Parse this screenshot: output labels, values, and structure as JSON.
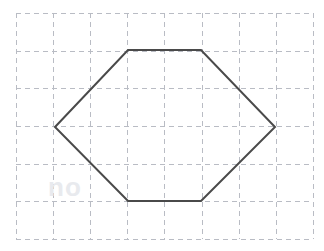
{
  "figure": {
    "canvas": {
      "width": 324,
      "height": 251,
      "background_color": "#ffffff"
    },
    "grid": {
      "color": "#b9bcc4",
      "dash": "5 4",
      "stroke_width": 1,
      "origin_x": 16,
      "origin_y": 13,
      "cell_width": 37.1,
      "cell_height": 37.7,
      "columns": 8,
      "rows": 6,
      "vertical_x": [
        16,
        53,
        90,
        127,
        164,
        202,
        239,
        276,
        313
      ],
      "horizontal_y": [
        13,
        51,
        88,
        126,
        164,
        201,
        239
      ]
    },
    "shape": {
      "name": "hexagon",
      "type": "polygon",
      "sides": 6,
      "stroke_color": "#4a4a4a",
      "stroke_width": 2,
      "fill": "none",
      "points": "55,127 128,50 201,50 275,127 201,201 128,201",
      "vertices": [
        {
          "label": "left",
          "x": 55,
          "y": 127,
          "grid_col": 1,
          "grid_row": 3
        },
        {
          "label": "top-left",
          "x": 128,
          "y": 50,
          "grid_col": 3,
          "grid_row": 1
        },
        {
          "label": "top-right",
          "x": 201,
          "y": 50,
          "grid_col": 5,
          "grid_row": 1
        },
        {
          "label": "right",
          "x": 275,
          "y": 127,
          "grid_col": 7,
          "grid_row": 3
        },
        {
          "label": "bottom-right",
          "x": 201,
          "y": 201,
          "grid_col": 5,
          "grid_row": 5
        },
        {
          "label": "bottom-left",
          "x": 128,
          "y": 201,
          "grid_col": 3,
          "grid_row": 5
        }
      ]
    },
    "watermark": {
      "color": "#e8eaee",
      "items": [
        {
          "text": "no",
          "x": 48,
          "y": 196
        }
      ]
    }
  }
}
